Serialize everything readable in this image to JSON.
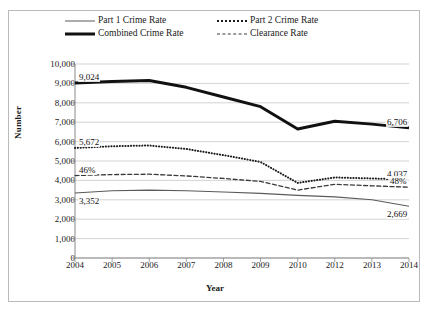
{
  "chart_data": {
    "type": "line",
    "title": "",
    "xlabel": "Year",
    "ylabel": "Number",
    "categories": [
      "2004",
      "2005",
      "2006",
      "2007",
      "2008",
      "2009",
      "2010",
      "2012",
      "2013",
      "2014"
    ],
    "ylim": [
      0,
      10000
    ],
    "ytick_labels": [
      "10,000",
      "9,000",
      "8,000",
      "7,000",
      "6,000",
      "5,000",
      "4,000",
      "3,000",
      "2,000",
      "1,000",
      "0"
    ],
    "ytick_values": [
      10000,
      9000,
      8000,
      7000,
      6000,
      5000,
      4000,
      3000,
      2000,
      1000,
      0
    ],
    "grid": true,
    "legend_position": "top",
    "series": [
      {
        "name": "Part 1 Crime Rate",
        "style": "thin-solid",
        "color": "#5a5a5a",
        "values": [
          3352,
          3470,
          3500,
          3470,
          3400,
          3330,
          3230,
          3150,
          3000,
          2669
        ]
      },
      {
        "name": "Part 2 Crime Rate",
        "style": "dotted",
        "color": "#1c1c1c",
        "values": [
          5672,
          5760,
          5800,
          5620,
          5300,
          4950,
          3870,
          4150,
          4100,
          4037
        ]
      },
      {
        "name": "Combined Crime Rate",
        "style": "thick-solid",
        "color": "#111111",
        "values": [
          9024,
          9100,
          9150,
          8800,
          8300,
          7800,
          6650,
          7050,
          6900,
          6706
        ]
      },
      {
        "name": "Clearance Rate",
        "style": "dashed",
        "color": "#3a3a3a",
        "values": [
          4250,
          4300,
          4320,
          4230,
          4100,
          3950,
          3500,
          3800,
          3720,
          3650
        ]
      }
    ],
    "annotations": [
      {
        "text": "9,024",
        "series": "Combined Crime Rate",
        "category": "2004",
        "position": "above-left"
      },
      {
        "text": "6,706",
        "series": "Combined Crime Rate",
        "category": "2014",
        "position": "above-right"
      },
      {
        "text": "5,672",
        "series": "Part 2 Crime Rate",
        "category": "2004",
        "position": "above-left"
      },
      {
        "text": "4,037",
        "series": "Part 2 Crime Rate",
        "category": "2014",
        "position": "above-right"
      },
      {
        "text": "46%",
        "series": "Clearance Rate",
        "category": "2004",
        "position": "above-left"
      },
      {
        "text": "48%",
        "series": "Clearance Rate",
        "category": "2014",
        "position": "above-right"
      },
      {
        "text": "3,352",
        "series": "Part 1 Crime Rate",
        "category": "2004",
        "position": "below-left"
      },
      {
        "text": "2,669",
        "series": "Part 1 Crime Rate",
        "category": "2014",
        "position": "below-right"
      }
    ]
  },
  "legend": {
    "items": [
      {
        "label": "Part 1 Crime Rate",
        "style": "thin-solid"
      },
      {
        "label": "Part 2 Crime Rate",
        "style": "dotted"
      },
      {
        "label": "Combined Crime Rate",
        "style": "thick-solid"
      },
      {
        "label": "Clearance Rate",
        "style": "dashed"
      }
    ]
  }
}
